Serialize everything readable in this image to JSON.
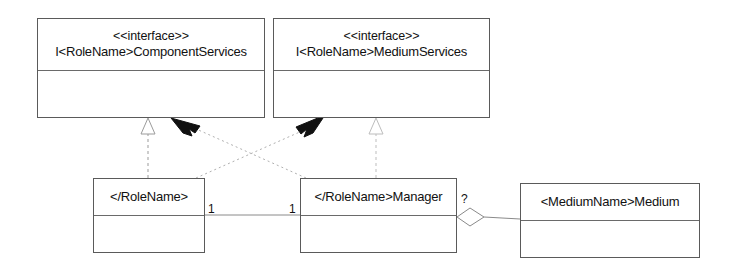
{
  "diagram": {
    "type": "uml-class-diagram",
    "background_color": "#ffffff",
    "line_color": "#5a5a5a",
    "text_color": "#111111"
  },
  "interfaces": [
    {
      "id": "component-services",
      "stereotype": "<<interface>>",
      "name": "I<RoleName>ComponentServices"
    },
    {
      "id": "medium-services",
      "stereotype": "<<interface>>",
      "name": "I<RoleName>MediumServices"
    }
  ],
  "classes": [
    {
      "id": "role-name",
      "name": "</RoleName>"
    },
    {
      "id": "role-name-manager",
      "name": "</RoleName>Manager"
    },
    {
      "id": "medium-name-medium",
      "name": "<MediumName>Medium"
    }
  ],
  "multiplicities": {
    "role_name_end": "1",
    "manager_left_end": "1",
    "manager_right_end": "?"
  },
  "relationships": [
    {
      "kind": "realization",
      "style": "dashed-hollow-triangle",
      "from": "role-name",
      "to": "component-services"
    },
    {
      "kind": "realization",
      "style": "dashed-hollow-triangle",
      "from": "role-name-manager",
      "to": "medium-services"
    },
    {
      "kind": "dependency",
      "style": "dotted-solid-arrow",
      "from": "role-name-manager",
      "to": "component-services"
    },
    {
      "kind": "dependency",
      "style": "dotted-solid-arrow",
      "from": "role-name",
      "to": "medium-services"
    },
    {
      "kind": "association",
      "style": "solid-line",
      "from": "role-name",
      "to": "role-name-manager"
    },
    {
      "kind": "aggregation",
      "style": "hollow-diamond",
      "from": "role-name-manager",
      "to": "medium-name-medium"
    }
  ]
}
